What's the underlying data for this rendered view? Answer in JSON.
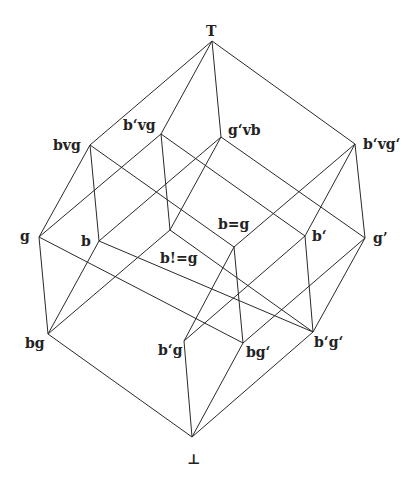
{
  "diagram": {
    "nodes": [
      {
        "id": "top",
        "label": "T",
        "x": 212,
        "y": 41,
        "lx": 206,
        "ly": 36
      },
      {
        "id": "bvg",
        "label": "bvg",
        "x": 90,
        "y": 145,
        "lx": 53,
        "ly": 150
      },
      {
        "id": "b'vg",
        "label": "b‘vg",
        "x": 161,
        "y": 134,
        "lx": 123,
        "ly": 130
      },
      {
        "id": "g'vb",
        "label": "g‘vb",
        "x": 221,
        "y": 137,
        "lx": 228,
        "ly": 135
      },
      {
        "id": "b'vg'",
        "label": "b‘vg‘",
        "x": 355,
        "y": 144,
        "lx": 363,
        "ly": 149
      },
      {
        "id": "g",
        "label": "g",
        "x": 39,
        "y": 237,
        "lx": 20,
        "ly": 241
      },
      {
        "id": "b",
        "label": "b",
        "x": 99,
        "y": 241,
        "lx": 81,
        "ly": 246
      },
      {
        "id": "bneqg",
        "label": "b!=g",
        "x": 170,
        "y": 230,
        "lx": 160,
        "ly": 263
      },
      {
        "id": "beqg",
        "label": "b=g",
        "x": 234,
        "y": 247,
        "lx": 218,
        "ly": 229
      },
      {
        "id": "b'",
        "label": "b‘",
        "x": 305,
        "y": 236,
        "lx": 312,
        "ly": 241
      },
      {
        "id": "g'",
        "label": "g’",
        "x": 365,
        "y": 238,
        "lx": 373,
        "ly": 243
      },
      {
        "id": "bg",
        "label": "bg",
        "x": 48,
        "y": 334,
        "lx": 25,
        "ly": 348
      },
      {
        "id": "b'g",
        "label": "b‘g",
        "x": 184,
        "y": 341,
        "lx": 158,
        "ly": 355
      },
      {
        "id": "bg'",
        "label": "bg‘",
        "x": 243,
        "y": 343,
        "lx": 246,
        "ly": 357
      },
      {
        "id": "b'g'",
        "label": "b‘g‘",
        "x": 313,
        "y": 332,
        "lx": 314,
        "ly": 347
      },
      {
        "id": "bottom",
        "label": "⊥",
        "x": 192,
        "y": 437,
        "lx": 187,
        "ly": 464
      }
    ],
    "edges": [
      [
        "top",
        "bvg"
      ],
      [
        "top",
        "b'vg"
      ],
      [
        "top",
        "g'vb"
      ],
      [
        "top",
        "b'vg'"
      ],
      [
        "bvg",
        "g"
      ],
      [
        "bvg",
        "b"
      ],
      [
        "bvg",
        "beqg"
      ],
      [
        "b'vg",
        "g"
      ],
      [
        "b'vg",
        "bneqg"
      ],
      [
        "b'vg",
        "b'"
      ],
      [
        "g'vb",
        "b"
      ],
      [
        "g'vb",
        "bneqg"
      ],
      [
        "g'vb",
        "g'"
      ],
      [
        "b'vg'",
        "beqg"
      ],
      [
        "b'vg'",
        "b'"
      ],
      [
        "b'vg'",
        "g'"
      ],
      [
        "g",
        "bg"
      ],
      [
        "g",
        "bg'"
      ],
      [
        "b",
        "bg"
      ],
      [
        "b",
        "b'g'"
      ],
      [
        "bneqg",
        "bg"
      ],
      [
        "bneqg",
        "b'g'"
      ],
      [
        "beqg",
        "b'g"
      ],
      [
        "beqg",
        "bg'"
      ],
      [
        "b'",
        "b'g"
      ],
      [
        "b'",
        "b'g'"
      ],
      [
        "g'",
        "bg'"
      ],
      [
        "g'",
        "b'g'"
      ],
      [
        "bg",
        "bottom"
      ],
      [
        "b'g",
        "bottom"
      ],
      [
        "bg'",
        "bottom"
      ],
      [
        "b'g'",
        "bottom"
      ]
    ]
  }
}
